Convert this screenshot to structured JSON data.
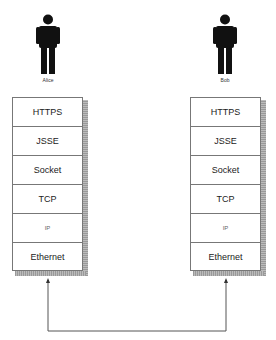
{
  "diagram": {
    "left": {
      "actor": "Alice",
      "layers": [
        "HTTPS",
        "JSSE",
        "Socket",
        "TCP",
        "IP",
        "Ethernet"
      ]
    },
    "right": {
      "actor": "Bob",
      "layers": [
        "HTTPS",
        "JSSE",
        "Socket",
        "TCP",
        "IP",
        "Ethernet"
      ]
    }
  }
}
